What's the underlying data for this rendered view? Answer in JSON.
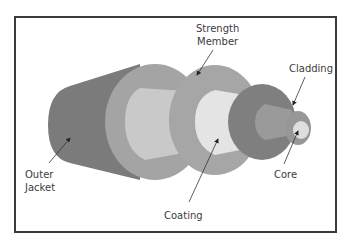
{
  "diagram": {
    "colors": {
      "outer_jacket": "#7b7b7b",
      "strength_member": "#a4a4a4",
      "strength_inner": "#c9c9c9",
      "coating_face": "#e4e4e4",
      "buffer_disc": "#7f7f7f",
      "buffer_inner": "#9a9a9a",
      "cladding": "#979797",
      "core": "#dedede",
      "border": "#3a3a3a",
      "text": "#3c3c3c"
    },
    "labels": {
      "strength_line1": "Strength",
      "strength_line2": "Member",
      "cladding": "Cladding",
      "outer_line1": "Outer",
      "outer_line2": "Jacket",
      "core": "Core",
      "coating": "Coating"
    }
  }
}
